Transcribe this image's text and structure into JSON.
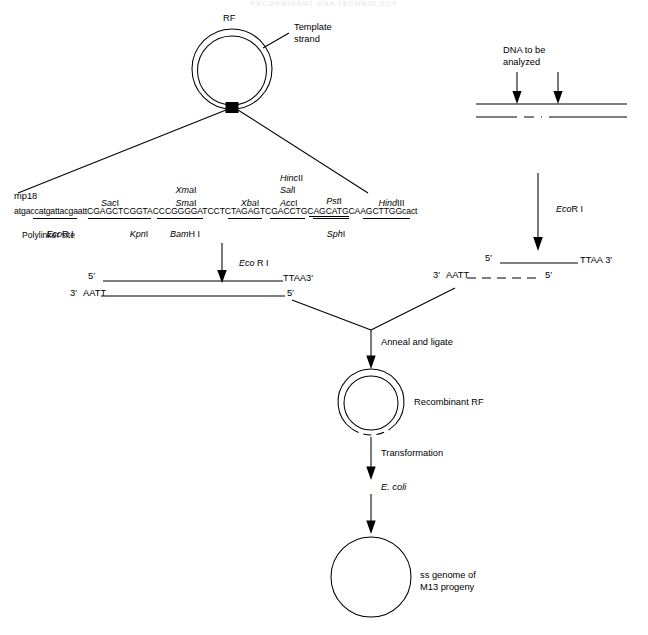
{
  "page": {
    "header": "RECOMBINANT DNA TECHNOLOGY",
    "width": 648,
    "height": 635,
    "background": "#ffffff",
    "ink": "#000000"
  },
  "vector": {
    "rf_label": "RF",
    "template_strand_label_line1": "Template",
    "template_strand_label_line2": "strand",
    "polylinker_marker": "black-square"
  },
  "polylinker": {
    "clone_name": "mp18",
    "sequence": "atgaccatgattacgaattCGAGCTCGGTACCCGGGGATCCTCTAGAGTCGACCTGCAGCATGCAAGCTTGGcact",
    "site_label": "Polylinker site",
    "sites_above": [
      {
        "name": "Sac I",
        "italic_part": "Sac",
        "roman_part": "I"
      },
      {
        "name": "Xma I",
        "italic_part": "Xma",
        "roman_part": "I"
      },
      {
        "name": "Sma I",
        "italic_part": "Sma",
        "roman_part": "I"
      },
      {
        "name": "Xba I",
        "italic_part": "Xba",
        "roman_part": "I"
      },
      {
        "name": "Hinc II",
        "italic_part": "Hinc",
        "roman_part": "II"
      },
      {
        "name": "Sal I",
        "italic_part": "Sal",
        "roman_part": "I"
      },
      {
        "name": "Acc I",
        "italic_part": "Acc",
        "roman_part": "I"
      },
      {
        "name": "Pst I",
        "italic_part": "Pst",
        "roman_part": "I"
      },
      {
        "name": "Hind III",
        "italic_part": "Hind",
        "roman_part": "III"
      }
    ],
    "sites_below": [
      {
        "name": "EcoR I",
        "italic_part": "Eco",
        "roman_part": "R I"
      },
      {
        "name": "Kpn I",
        "italic_part": "Kpn",
        "roman_part": "I"
      },
      {
        "name": "BamH I",
        "italic_part": "Bam",
        "roman_part": "H I"
      },
      {
        "name": "Sph I",
        "italic_part": "Sph",
        "roman_part": "I"
      }
    ]
  },
  "insert_source": {
    "label_line1": "DNA to be",
    "label_line2": "analyzed",
    "arrow_count": 2,
    "top_strand_style": "solid",
    "bottom_strand_style": "dashed-middle"
  },
  "steps": {
    "digest_vector": {
      "italic": "Eco",
      "roman": " R I"
    },
    "digest_insert": {
      "italic": "Eco",
      "roman": "R I"
    },
    "anneal": "Anneal and ligate",
    "transformation": "Transformation",
    "host": "E. coli"
  },
  "cut_vector": {
    "top_left_prime": "5′",
    "top_right_text": "TTAA3′",
    "bottom_left_prime": "3′",
    "bottom_left_text": "AATT",
    "bottom_right_prime": "5′",
    "top_line_style": "solid",
    "bottom_line_style": "solid"
  },
  "cut_insert": {
    "top_left_prime": "5′",
    "top_right_text": "TTAA 3′",
    "bottom_left_prime": "3′",
    "bottom_left_text": "AATT",
    "bottom_right_prime": "5′",
    "top_line_style": "solid",
    "bottom_line_style": "dashed"
  },
  "products": {
    "recombinant_rf": "Recombinant RF",
    "ss_genome_line1": "ss genome of",
    "ss_genome_line2": "M13 progeny"
  }
}
